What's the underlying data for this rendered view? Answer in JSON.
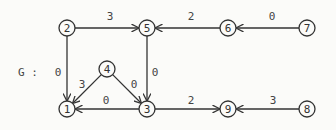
{
  "graph": {
    "name": "G :",
    "nodes": [
      {
        "id": "1",
        "x": 67,
        "y": 109
      },
      {
        "id": "2",
        "x": 67,
        "y": 28
      },
      {
        "id": "3",
        "x": 147,
        "y": 109
      },
      {
        "id": "4",
        "x": 107,
        "y": 69
      },
      {
        "id": "5",
        "x": 147,
        "y": 28
      },
      {
        "id": "6",
        "x": 228,
        "y": 28
      },
      {
        "id": "7",
        "x": 307,
        "y": 28
      },
      {
        "id": "8",
        "x": 307,
        "y": 109
      },
      {
        "id": "9",
        "x": 228,
        "y": 109
      }
    ],
    "edges": [
      {
        "from": "2",
        "to": "5",
        "weight": "3",
        "lx": 110,
        "ly": 16
      },
      {
        "from": "6",
        "to": "5",
        "weight": "2",
        "lx": 191,
        "ly": 16
      },
      {
        "from": "7",
        "to": "6",
        "weight": "0",
        "lx": 272,
        "ly": 16
      },
      {
        "from": "2",
        "to": "1",
        "weight": "0",
        "lx": 58,
        "ly": 72
      },
      {
        "from": "5",
        "to": "3",
        "weight": "0",
        "lx": 155,
        "ly": 72
      },
      {
        "from": "4",
        "to": "1",
        "weight": "3",
        "lx": 82,
        "ly": 84
      },
      {
        "from": "4",
        "to": "3",
        "weight": "0",
        "lx": 134,
        "ly": 84
      },
      {
        "from": "3",
        "to": "1",
        "weight": "0",
        "lx": 106,
        "ly": 100
      },
      {
        "from": "3",
        "to": "9",
        "weight": "2",
        "lx": 191,
        "ly": 100
      },
      {
        "from": "8",
        "to": "9",
        "weight": "3",
        "lx": 273,
        "ly": 100
      }
    ]
  }
}
